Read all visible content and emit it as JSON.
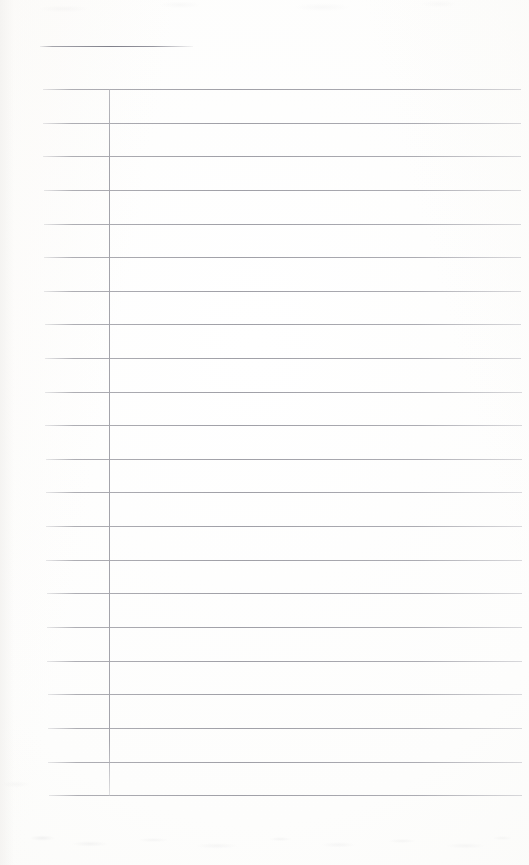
{
  "document": {
    "kind": "scanned-blank-ruled-page",
    "title": "",
    "page_width": 529,
    "page_height": 865,
    "background_color": "#fefefe",
    "paper_tint": "#fbfbf9",
    "rule_color": "#bcbcc0",
    "heading_rule_color": "#80808a",
    "vertical_rule_color": "#a4a4ab",
    "text_content": "",
    "is_blank": true
  },
  "heading_rule": {
    "label": "",
    "x": 40,
    "y": 46,
    "width": 153,
    "thickness": 1
  },
  "margin_rule": {
    "label": "",
    "x": 109,
    "y_top": 89,
    "y_bottom": 796,
    "thickness": 1
  },
  "ruled_lines": {
    "count": 22,
    "spacing": 33.6,
    "first_y": 89,
    "last_y": 795,
    "left_x": 44,
    "right_x": 522,
    "lines": [
      {
        "index": 1,
        "y": 89,
        "x1": 43,
        "x2": 521,
        "content": ""
      },
      {
        "index": 2,
        "y": 123,
        "x1": 43,
        "x2": 521,
        "content": ""
      },
      {
        "index": 3,
        "y": 156,
        "x1": 43,
        "x2": 521,
        "content": ""
      },
      {
        "index": 4,
        "y": 190,
        "x1": 44,
        "x2": 521,
        "content": ""
      },
      {
        "index": 5,
        "y": 224,
        "x1": 44,
        "x2": 521,
        "content": ""
      },
      {
        "index": 6,
        "y": 257,
        "x1": 44,
        "x2": 521,
        "content": ""
      },
      {
        "index": 7,
        "y": 291,
        "x1": 44,
        "x2": 521,
        "content": ""
      },
      {
        "index": 8,
        "y": 324,
        "x1": 45,
        "x2": 521,
        "content": ""
      },
      {
        "index": 9,
        "y": 358,
        "x1": 45,
        "x2": 521,
        "content": ""
      },
      {
        "index": 10,
        "y": 392,
        "x1": 45,
        "x2": 522,
        "content": ""
      },
      {
        "index": 11,
        "y": 425,
        "x1": 45,
        "x2": 522,
        "content": ""
      },
      {
        "index": 12,
        "y": 459,
        "x1": 46,
        "x2": 522,
        "content": ""
      },
      {
        "index": 13,
        "y": 492,
        "x1": 46,
        "x2": 522,
        "content": ""
      },
      {
        "index": 14,
        "y": 526,
        "x1": 46,
        "x2": 522,
        "content": ""
      },
      {
        "index": 15,
        "y": 560,
        "x1": 46,
        "x2": 522,
        "content": ""
      },
      {
        "index": 16,
        "y": 593,
        "x1": 47,
        "x2": 522,
        "content": ""
      },
      {
        "index": 17,
        "y": 627,
        "x1": 47,
        "x2": 522,
        "content": ""
      },
      {
        "index": 18,
        "y": 661,
        "x1": 47,
        "x2": 522,
        "content": ""
      },
      {
        "index": 19,
        "y": 694,
        "x1": 48,
        "x2": 522,
        "content": ""
      },
      {
        "index": 20,
        "y": 728,
        "x1": 48,
        "x2": 522,
        "content": ""
      },
      {
        "index": 21,
        "y": 762,
        "x1": 48,
        "x2": 522,
        "content": ""
      },
      {
        "index": 22,
        "y": 795,
        "x1": 49,
        "x2": 522,
        "content": ""
      }
    ]
  },
  "columns": [
    {
      "name": "left-column",
      "x1": 43,
      "x2": 109,
      "content": ""
    },
    {
      "name": "right-column",
      "x1": 109,
      "x2": 522,
      "content": ""
    }
  ]
}
